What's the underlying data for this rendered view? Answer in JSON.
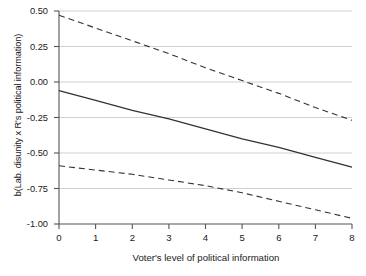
{
  "chart_data": {
    "type": "line",
    "title": "",
    "xlabel": "Voter's level of  political information",
    "ylabel": "b(Lab. disunity x R's political information)",
    "xlim": [
      0,
      8
    ],
    "ylim": [
      -1.0,
      0.5
    ],
    "xticks": [
      "0",
      "1",
      "2",
      "3",
      "4",
      "5",
      "6",
      "7",
      "8"
    ],
    "xtick_values": [
      0,
      1,
      2,
      3,
      4,
      5,
      6,
      7,
      8
    ],
    "yticks": [
      "0.50",
      "0.25",
      "0.00",
      "-0.25",
      "-0.50",
      "-0.75",
      "-1.00"
    ],
    "ytick_values": [
      0.5,
      0.25,
      0.0,
      -0.25,
      -0.5,
      -0.75,
      -1.0
    ],
    "grid": "horizontal",
    "legend": "none",
    "series": [
      {
        "name": "Upper 95% confidence bound",
        "style": "dashed",
        "color": "#333333",
        "x": [
          0,
          1,
          2,
          3,
          4,
          5,
          6,
          7,
          8
        ],
        "values": [
          0.47,
          0.38,
          0.29,
          0.2,
          0.1,
          0.01,
          -0.08,
          -0.18,
          -0.27
        ]
      },
      {
        "name": "Marginal effect",
        "style": "solid",
        "color": "#333333",
        "x": [
          0,
          1,
          2,
          3,
          4,
          5,
          6,
          7,
          8
        ],
        "values": [
          -0.06,
          -0.13,
          -0.2,
          -0.26,
          -0.33,
          -0.4,
          -0.46,
          -0.53,
          -0.6
        ]
      },
      {
        "name": "Lower 95% confidence bound",
        "style": "dashed",
        "color": "#333333",
        "x": [
          0,
          1,
          2,
          3,
          4,
          5,
          6,
          7,
          8
        ],
        "values": [
          -0.59,
          -0.62,
          -0.65,
          -0.69,
          -0.73,
          -0.78,
          -0.84,
          -0.9,
          -0.96
        ]
      }
    ]
  },
  "caption": ""
}
